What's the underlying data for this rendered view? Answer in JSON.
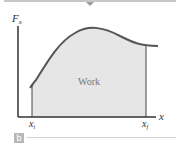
{
  "diagram": {
    "y_axis_label": "F",
    "y_axis_sub": "x",
    "x_axis_label": "x",
    "x_start_label": "x",
    "x_start_sub": "i",
    "x_end_label": "x",
    "x_end_sub": "f",
    "area_label": "Work",
    "panel_label": "b",
    "colors": {
      "curve": "#555555",
      "area_fill": "#e6e6e6",
      "axis": "#333333"
    }
  }
}
